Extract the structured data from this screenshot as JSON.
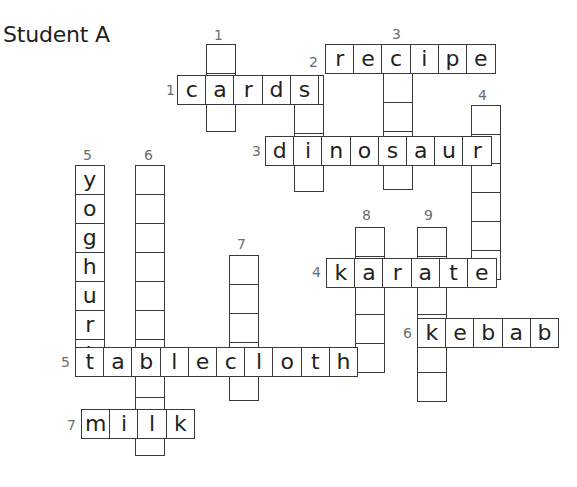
{
  "title": "Student A",
  "puzzle": {
    "cell_width": 29.5,
    "cell_height": 30.3,
    "across": [
      {
        "number": "1",
        "answer": "cards",
        "letters": [
          "c",
          "a",
          "r",
          "d",
          "s"
        ],
        "x": 177,
        "y": 75,
        "label_x": 166,
        "label_y": 83
      },
      {
        "number": "2",
        "answer": "recipe",
        "letters": [
          "r",
          "e",
          "c",
          "i",
          "p",
          "e"
        ],
        "x": 325,
        "y": 44,
        "label_x": 309,
        "label_y": 55
      },
      {
        "number": "3",
        "answer": "dinosaur",
        "letters": [
          "d",
          "i",
          "n",
          "o",
          "s",
          "a",
          "u",
          "r"
        ],
        "x": 265,
        "y": 136,
        "label_x": 252,
        "label_y": 144
      },
      {
        "number": "4",
        "answer": "karate",
        "letters": [
          "k",
          "a",
          "r",
          "a",
          "t",
          "e"
        ],
        "x": 326,
        "y": 258,
        "label_x": 312,
        "label_y": 265
      },
      {
        "number": "5",
        "answer": "tablecloth",
        "letters": [
          "t",
          "a",
          "b",
          "l",
          "e",
          "c",
          "l",
          "o",
          "t",
          "h"
        ],
        "x": 75,
        "y": 347,
        "label_x": 61,
        "label_y": 355
      },
      {
        "number": "6",
        "answer": "kebab",
        "letters": [
          "k",
          "e",
          "b",
          "a",
          "b"
        ],
        "x": 417,
        "y": 318,
        "label_x": 403,
        "label_y": 326
      },
      {
        "number": "7",
        "answer": "milk",
        "letters": [
          "m",
          "i",
          "l",
          "k"
        ],
        "x": 81,
        "y": 409,
        "label_x": 67,
        "label_y": 418
      }
    ],
    "down": [
      {
        "number": "1",
        "letters": [
          "",
          "",
          ""
        ],
        "x": 206,
        "y": 44,
        "label_x": 214,
        "label_y": 28
      },
      {
        "number": "",
        "letters": [
          "",
          "",
          "",
          ""
        ],
        "x": 294,
        "y": 75,
        "label_x": 0,
        "label_y": 0
      },
      {
        "number": "3",
        "letters": [
          "",
          "",
          "",
          "",
          ""
        ],
        "x": 383,
        "y": 44,
        "label_x": 392,
        "label_y": 27
      },
      {
        "number": "4",
        "letters": [
          "",
          "",
          "",
          "",
          "",
          ""
        ],
        "x": 471,
        "y": 105,
        "label_x": 478,
        "label_y": 88
      },
      {
        "number": "5",
        "letters": [
          "y",
          "o",
          "g",
          "h",
          "u",
          "r",
          "t"
        ],
        "x": 75,
        "y": 165,
        "label_x": 83,
        "label_y": 148
      },
      {
        "number": "6",
        "letters": [
          "",
          "",
          "",
          "",
          "",
          "",
          "",
          "",
          "",
          ""
        ],
        "x": 135,
        "y": 165,
        "label_x": 144,
        "label_y": 148
      },
      {
        "number": "7",
        "letters": [
          "",
          "",
          "",
          "",
          ""
        ],
        "x": 229,
        "y": 255,
        "label_x": 237,
        "label_y": 237
      },
      {
        "number": "8",
        "letters": [
          "",
          "",
          "",
          "",
          ""
        ],
        "x": 355,
        "y": 227,
        "label_x": 362,
        "label_y": 208
      },
      {
        "number": "9",
        "letters": [
          "",
          "",
          "",
          "",
          "",
          ""
        ],
        "x": 417,
        "y": 227,
        "label_x": 424,
        "label_y": 208
      }
    ]
  }
}
